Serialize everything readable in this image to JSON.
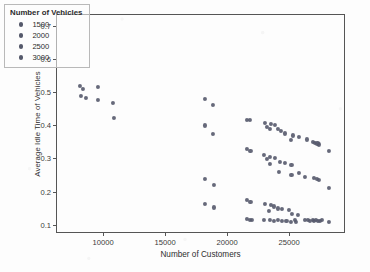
{
  "chart_data": {
    "type": "scatter",
    "title": "",
    "xlabel": "Number of Customers",
    "ylabel": "Average Idle Time of Vehicles",
    "xlim": [
      6200,
      29500
    ],
    "ylim": [
      0.075,
      0.735
    ],
    "xticks": [
      10000,
      15000,
      20000,
      25000
    ],
    "xtick_labels": [
      "10000",
      "15000",
      "20000",
      "25000"
    ],
    "yticks": [
      0.1,
      0.2,
      0.3,
      0.4,
      0.5,
      0.6,
      0.7
    ],
    "ytick_labels": [
      "0.1",
      "0.2",
      "0.3",
      "0.4",
      "0.5",
      "0.6",
      "0.7"
    ],
    "grid": false,
    "legend": {
      "title": "Number of Vehicles",
      "position": "upper-left-inside",
      "entries": [
        {
          "label": "1500",
          "color": "#55596b"
        },
        {
          "label": "2000",
          "color": "#55596b"
        },
        {
          "label": "2500",
          "color": "#55596b"
        },
        {
          "label": "3000",
          "color": "#55596b"
        }
      ]
    },
    "marker_color": "#55596b",
    "series": [
      {
        "name": "1500",
        "points": [
          [
            8050,
            0.52
          ],
          [
            8300,
            0.512
          ],
          [
            9500,
            0.518
          ],
          [
            8100,
            0.492
          ],
          [
            8500,
            0.484
          ],
          [
            9500,
            0.48
          ],
          [
            10700,
            0.47
          ],
          [
            10800,
            0.425
          ],
          [
            18100,
            0.483
          ],
          [
            18800,
            0.465
          ],
          [
            21550,
            0.42
          ],
          [
            21750,
            0.42
          ],
          [
            22950,
            0.41
          ],
          [
            23450,
            0.408
          ],
          [
            23100,
            0.398
          ],
          [
            23750,
            0.405
          ],
          [
            23350,
            0.392
          ],
          [
            24050,
            0.392
          ],
          [
            24250,
            0.385
          ],
          [
            24600,
            0.378
          ],
          [
            25250,
            0.372
          ],
          [
            25700,
            0.368
          ],
          [
            25050,
            0.358
          ],
          [
            26350,
            0.36
          ],
          [
            26800,
            0.352
          ],
          [
            27000,
            0.35
          ],
          [
            27200,
            0.348
          ],
          [
            27350,
            0.345
          ],
          [
            28150,
            0.325
          ]
        ]
      },
      {
        "name": "2000",
        "points": [
          [
            18100,
            0.402
          ],
          [
            18800,
            0.377
          ],
          [
            21550,
            0.33
          ],
          [
            21800,
            0.325
          ],
          [
            22900,
            0.312
          ],
          [
            23350,
            0.308
          ],
          [
            23100,
            0.3
          ],
          [
            23800,
            0.305
          ],
          [
            23350,
            0.285
          ],
          [
            24200,
            0.292
          ],
          [
            24600,
            0.288
          ],
          [
            25100,
            0.282
          ],
          [
            24100,
            0.262
          ],
          [
            25100,
            0.252
          ],
          [
            25700,
            0.26
          ],
          [
            26200,
            0.248
          ],
          [
            26900,
            0.244
          ],
          [
            27150,
            0.24
          ],
          [
            27300,
            0.238
          ],
          [
            28150,
            0.215
          ]
        ]
      },
      {
        "name": "2500",
        "points": [
          [
            18150,
            0.242
          ],
          [
            18850,
            0.222
          ],
          [
            21500,
            0.178
          ],
          [
            21800,
            0.172
          ],
          [
            22950,
            0.165
          ],
          [
            23450,
            0.162
          ],
          [
            23700,
            0.158
          ],
          [
            24050,
            0.152
          ],
          [
            24300,
            0.15
          ],
          [
            24900,
            0.148
          ],
          [
            25150,
            0.135
          ],
          [
            25600,
            0.133
          ],
          [
            23300,
            0.145
          ]
        ]
      },
      {
        "name": "3000",
        "points": [
          [
            18150,
            0.165
          ],
          [
            18850,
            0.155
          ],
          [
            21500,
            0.12
          ],
          [
            21750,
            0.118
          ],
          [
            21900,
            0.116
          ],
          [
            22900,
            0.118
          ],
          [
            23350,
            0.116
          ],
          [
            23700,
            0.115
          ],
          [
            24050,
            0.116
          ],
          [
            24350,
            0.114
          ],
          [
            24700,
            0.115
          ],
          [
            25050,
            0.112
          ],
          [
            25350,
            0.118
          ],
          [
            25500,
            0.112
          ],
          [
            26200,
            0.118
          ],
          [
            26400,
            0.116
          ],
          [
            26600,
            0.114
          ],
          [
            26800,
            0.116
          ],
          [
            26950,
            0.113
          ],
          [
            27100,
            0.118
          ],
          [
            27250,
            0.115
          ],
          [
            27400,
            0.113
          ],
          [
            27550,
            0.116
          ],
          [
            28150,
            0.112
          ]
        ]
      }
    ]
  }
}
